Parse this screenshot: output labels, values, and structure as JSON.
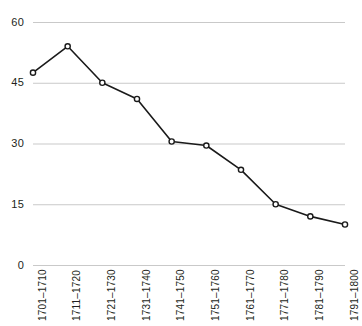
{
  "chart_data": {
    "type": "line",
    "title": "",
    "subtitle": "",
    "xlabel": "",
    "ylabel": "",
    "categories": [
      "1701–1710",
      "1711–1720",
      "1721–1730",
      "1731–1740",
      "1741–1750",
      "1751–1760",
      "1761–1770",
      "1771–1780",
      "1781–1790",
      "1791–1800"
    ],
    "values": [
      47.5,
      54,
      45,
      41,
      30.5,
      29.5,
      23.5,
      15,
      12,
      10
    ],
    "series": [
      {
        "name": "",
        "values": [
          47.5,
          54,
          45,
          41,
          30.5,
          29.5,
          23.5,
          15,
          12,
          10
        ]
      }
    ],
    "ylim": [
      0,
      60
    ],
    "yticks": [
      0,
      15,
      30,
      45,
      60
    ],
    "ytick_labels": [
      "0",
      "15",
      "30",
      "45",
      "60"
    ],
    "grid": "horizontal",
    "legend": "none",
    "marker": "open-circle",
    "line_color": "#1a1a1a",
    "marker_fill": "#ffffff",
    "grid_color": "#c9c9c9",
    "background": "#ffffff",
    "text_color": "#231f20"
  }
}
